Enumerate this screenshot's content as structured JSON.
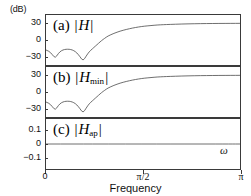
{
  "figure": {
    "unit_label": "(dB)",
    "xaxis_title": "Frequency",
    "omega_symbol": "ω"
  },
  "xaxis": {
    "ticks": [
      {
        "label": "0",
        "value": 0.0
      },
      {
        "label": "π/2",
        "value": 0.5
      },
      {
        "label": "π",
        "value": 1.0
      }
    ],
    "range": [
      0,
      1
    ]
  },
  "panels": {
    "a": {
      "tag": "(a)",
      "symbol": "H",
      "subscript": "",
      "yticks": [
        "30",
        "0",
        "−30"
      ],
      "ylim": [
        -45,
        45
      ]
    },
    "b": {
      "tag": "(b)",
      "symbol": "H",
      "subscript": "min",
      "yticks": [
        "30",
        "0",
        "−30"
      ],
      "ylim": [
        -45,
        45
      ]
    },
    "c": {
      "tag": "(c)",
      "symbol": "H",
      "subscript": "ap",
      "yticks": [
        "0.1",
        "0",
        "−0.1"
      ],
      "ylim": [
        -0.18,
        0.18
      ]
    }
  },
  "chart_data": [
    {
      "type": "line",
      "title": "(a) |H|",
      "xlabel": "Frequency",
      "ylabel": "(dB)",
      "xlim": [
        0,
        3.14159
      ],
      "ylim": [
        -45,
        45
      ],
      "xticks": [
        0,
        1.5708,
        3.14159
      ],
      "xticklabels": [
        "0",
        "π/2",
        "π"
      ],
      "yticks": [
        30,
        0,
        -30
      ],
      "grid": false,
      "legend": null,
      "series": [
        {
          "name": "|H|",
          "x": [
            0.0,
            0.05,
            0.1,
            0.15,
            0.2,
            0.25,
            0.3,
            0.35,
            0.4,
            0.45,
            0.5,
            0.55,
            0.6,
            0.65,
            0.7,
            0.75,
            0.8,
            0.85,
            0.9,
            0.95,
            1.0,
            1.1,
            1.2,
            1.3,
            1.4,
            1.5,
            1.6,
            1.7,
            1.8,
            1.9,
            2.0,
            2.2,
            2.4,
            2.6,
            2.8,
            3.0,
            3.14159
          ],
          "y": [
            -18,
            -20,
            -26,
            -33,
            -24,
            -19,
            -17,
            -16.5,
            -17,
            -19,
            -23,
            -30,
            -38,
            -29,
            -21,
            -16,
            -11,
            -6,
            -1,
            3,
            7,
            12,
            16,
            19,
            21.5,
            23.5,
            25,
            26,
            27,
            27.6,
            28,
            28.8,
            29.3,
            29.6,
            29.8,
            29.9,
            30
          ]
        }
      ]
    },
    {
      "type": "line",
      "title": "(b) |Hmin|",
      "xlabel": "Frequency",
      "ylabel": "(dB)",
      "xlim": [
        0,
        3.14159
      ],
      "ylim": [
        -45,
        45
      ],
      "xticks": [
        0,
        1.5708,
        3.14159
      ],
      "xticklabels": [
        "0",
        "π/2",
        "π"
      ],
      "yticks": [
        30,
        0,
        -30
      ],
      "grid": false,
      "legend": null,
      "series": [
        {
          "name": "|Hmin|",
          "x": [
            0.0,
            0.05,
            0.1,
            0.15,
            0.2,
            0.25,
            0.3,
            0.35,
            0.4,
            0.45,
            0.5,
            0.55,
            0.6,
            0.65,
            0.7,
            0.75,
            0.8,
            0.85,
            0.9,
            0.95,
            1.0,
            1.1,
            1.2,
            1.3,
            1.4,
            1.5,
            1.6,
            1.7,
            1.8,
            1.9,
            2.0,
            2.2,
            2.4,
            2.6,
            2.8,
            3.0,
            3.14159
          ],
          "y": [
            -18,
            -20,
            -26,
            -33,
            -24,
            -19,
            -17,
            -16.5,
            -17,
            -19,
            -23,
            -30,
            -38,
            -29,
            -21,
            -16,
            -11,
            -6,
            -1,
            3,
            7,
            12,
            16,
            19,
            21.5,
            23.5,
            25,
            26,
            27,
            27.6,
            28,
            28.8,
            29.3,
            29.6,
            29.8,
            29.9,
            30
          ]
        }
      ]
    },
    {
      "type": "line",
      "title": "(c) |Hap|",
      "xlabel": "Frequency",
      "ylabel": "(dB)",
      "xlim": [
        0,
        3.14159
      ],
      "ylim": [
        -0.18,
        0.18
      ],
      "xticks": [
        0,
        1.5708,
        3.14159
      ],
      "xticklabels": [
        "0",
        "π/2",
        "π"
      ],
      "yticks": [
        0.1,
        0,
        -0.1
      ],
      "grid": false,
      "legend": null,
      "series": [
        {
          "name": "|Hap|",
          "x": [
            0.0,
            0.5,
            1.0,
            1.5708,
            2.0,
            2.5,
            3.0,
            3.14159
          ],
          "y": [
            0.0,
            0.0,
            0.0,
            0.0,
            0.0,
            0.0,
            0.0,
            0.0
          ]
        }
      ]
    }
  ]
}
